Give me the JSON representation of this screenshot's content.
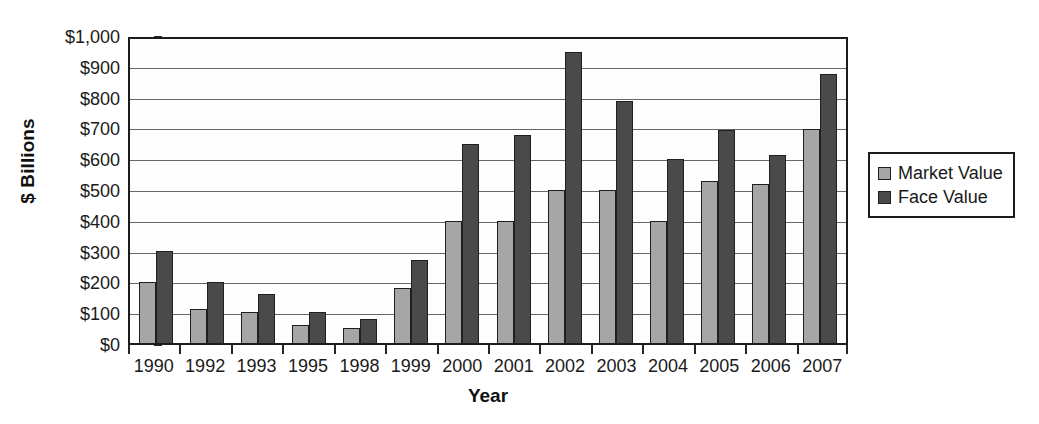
{
  "chart_data": {
    "type": "bar",
    "title": "",
    "subtitle": "",
    "xlabel": "Year",
    "ylabel": "$ Billions",
    "ylim": [
      0,
      1000
    ],
    "ytick_step": 100,
    "grid": true,
    "legend_position": "right",
    "categories": [
      "1990",
      "1992",
      "1993",
      "1995",
      "1998",
      "1999",
      "2000",
      "2001",
      "2002",
      "2003",
      "2004",
      "2005",
      "2006",
      "2007"
    ],
    "ytick_labels": [
      "$1,000",
      "$900",
      "$800",
      "$700",
      "$600",
      "$500",
      "$400",
      "$300",
      "$200",
      "$100",
      "$0"
    ],
    "ytick_values": [
      1000,
      900,
      800,
      700,
      600,
      500,
      400,
      300,
      200,
      100,
      0
    ],
    "series": [
      {
        "name": "Market Value",
        "color": "#a6a6a6",
        "values": [
          200,
          110,
          100,
          60,
          50,
          180,
          400,
          400,
          500,
          500,
          400,
          530,
          520,
          700
        ]
      },
      {
        "name": "Face Value",
        "color": "#4a4a4a",
        "values": [
          300,
          200,
          160,
          100,
          80,
          270,
          650,
          680,
          950,
          790,
          600,
          695,
          615,
          880
        ]
      }
    ]
  },
  "legend": {
    "items": [
      {
        "label": "Market Value",
        "swatch": "market"
      },
      {
        "label": "Face Value",
        "swatch": "face"
      }
    ]
  },
  "colors": {
    "market_value": "#a6a6a6",
    "face_value": "#4a4a4a",
    "axis": "#1c1c1c",
    "gridline": "#666666",
    "background": "#ffffff"
  }
}
